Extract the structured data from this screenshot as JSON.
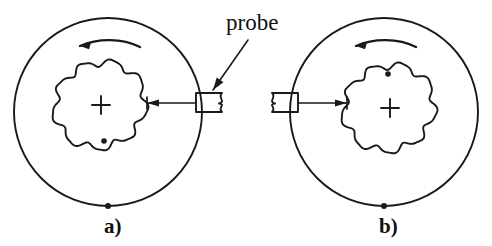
{
  "figure": {
    "type": "technical-line-diagram",
    "background_color": "#ffffff",
    "ink_color": "#1a1a1a",
    "width": 492,
    "height": 246,
    "callout": {
      "label": "probe",
      "label_x": 226,
      "label_y": 30,
      "arrow_from": {
        "x": 248,
        "y": 40
      },
      "arrow_to": {
        "x": 213,
        "y": 90
      }
    },
    "panels": [
      {
        "id": "a",
        "label": "a)",
        "label_x": 104,
        "label_y": 233,
        "outer_circle": {
          "cx": 108,
          "cy": 112,
          "r": 94
        },
        "outer_marker_dot": {
          "cx": 108,
          "cy": 206,
          "r": 3.0,
          "position": "bottom"
        },
        "rotation_arrow": {
          "direction": "counterclockwise",
          "arc_start": {
            "x": 80,
            "y": 46
          },
          "arc_end": {
            "x": 140,
            "y": 47
          },
          "arc_peak_y": 38,
          "arrowhead_at": "start-left"
        },
        "inner_blob": {
          "cx": 100,
          "cy": 105,
          "mean_radius": 44,
          "lobes": 9,
          "amplitude": 3.5
        },
        "center_cross": {
          "cx": 101,
          "cy": 105,
          "arm": 9
        },
        "blob_marker_dot": {
          "cx": 104,
          "cy": 141,
          "r": 2.8,
          "position": "bottom"
        },
        "probe": {
          "x": 196,
          "y": 93,
          "width": 26,
          "height": 19,
          "notch_side": "right"
        },
        "probe_arrow": {
          "from": {
            "x": 196,
            "y": 103
          },
          "to": {
            "x": 147,
            "y": 103
          },
          "arrowhead_at": "to-left",
          "tick_x": 147
        }
      },
      {
        "id": "b",
        "label": "b)",
        "label_x": 379,
        "label_y": 233,
        "outer_circle": {
          "cx": 384,
          "cy": 112,
          "r": 94
        },
        "outer_marker_dot": {
          "cx": 384,
          "cy": 206,
          "r": 3.0,
          "position": "bottom"
        },
        "rotation_arrow": {
          "direction": "counterclockwise",
          "arc_start": {
            "x": 356,
            "y": 46
          },
          "arc_end": {
            "x": 416,
            "y": 47
          },
          "arc_peak_y": 38,
          "arrowhead_at": "start-left"
        },
        "inner_blob": {
          "cx": 389,
          "cy": 108,
          "mean_radius": 44,
          "lobes": 9,
          "amplitude": 3.5
        },
        "center_cross": {
          "cx": 390,
          "cy": 108,
          "arm": 9
        },
        "blob_marker_dot": {
          "cx": 388,
          "cy": 74,
          "r": 2.8,
          "position": "top"
        },
        "probe": {
          "x": 272,
          "y": 93,
          "width": 26,
          "height": 19,
          "notch_side": "left"
        },
        "probe_arrow": {
          "from": {
            "x": 298,
            "y": 103
          },
          "to": {
            "x": 347,
            "y": 103
          },
          "arrowhead_at": "to-right",
          "tick_x": 347
        }
      }
    ]
  }
}
